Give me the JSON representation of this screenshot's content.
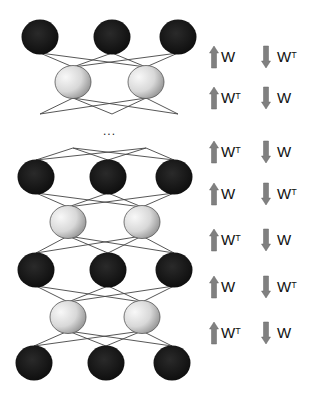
{
  "diagram": {
    "ellipsis": "...",
    "layers": [
      {
        "type": "visible",
        "y": 37,
        "x": [
          40,
          112,
          178
        ]
      },
      {
        "type": "hidden",
        "y": 82,
        "x": [
          73,
          146
        ]
      },
      {
        "type": "visible",
        "y": 177,
        "x": [
          36,
          108,
          174
        ]
      },
      {
        "type": "hidden",
        "y": 222,
        "x": [
          68,
          142
        ]
      },
      {
        "type": "visible",
        "y": 270,
        "x": [
          36,
          108,
          174
        ]
      },
      {
        "type": "hidden",
        "y": 317,
        "x": [
          68,
          142
        ]
      },
      {
        "type": "visible",
        "y": 363,
        "x": [
          34,
          106,
          172
        ]
      }
    ],
    "colors": {
      "visible_unit": "#111111",
      "hidden_unit_light": "#f2f2f2",
      "hidden_unit_dark": "#9a9a9a",
      "arrow": "#808080",
      "edge": "#444444"
    },
    "weight_rows": [
      {
        "up": "W",
        "up_sup": "",
        "down": "W",
        "down_sup": "T"
      },
      {
        "up": "W",
        "up_sup": "T",
        "down": "W",
        "down_sup": ""
      },
      {
        "up": "W",
        "up_sup": "T",
        "down": "W",
        "down_sup": ""
      },
      {
        "up": "W",
        "up_sup": "",
        "down": "W",
        "down_sup": "T"
      },
      {
        "up": "W",
        "up_sup": "T",
        "down": "W",
        "down_sup": ""
      },
      {
        "up": "W",
        "up_sup": "",
        "down": "W",
        "down_sup": "T"
      },
      {
        "up": "W",
        "up_sup": "T",
        "down": "W",
        "down_sup": ""
      }
    ]
  }
}
